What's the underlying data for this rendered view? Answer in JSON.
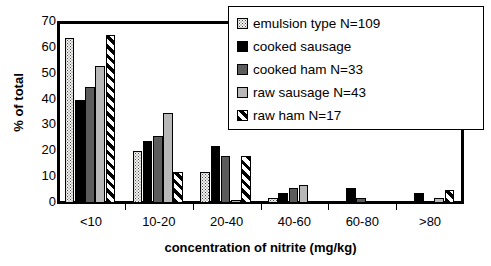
{
  "chart_data": {
    "type": "bar",
    "title": "",
    "xlabel": "concentration of nitrite (mg/kg)",
    "ylabel": "% of total",
    "categories": [
      "<10",
      "10-20",
      "20-40",
      "40-60",
      "60-80",
      ">80"
    ],
    "ylim": [
      0,
      70
    ],
    "yticks": [
      0,
      10,
      20,
      30,
      40,
      50,
      60,
      70
    ],
    "grid": true,
    "legend_position": "top-right",
    "series": [
      {
        "name": "emulsion type N=109",
        "pattern": "dotted",
        "color": "#f2f2f0",
        "values": [
          64,
          20,
          12,
          2,
          0,
          0
        ]
      },
      {
        "name": "cooked sausage",
        "pattern": "solid-black",
        "color": "#000000",
        "values": [
          40,
          24,
          22,
          4,
          6,
          4
        ]
      },
      {
        "name": "cooked ham N=33",
        "pattern": "dark-gray",
        "color": "#5c5c5c",
        "values": [
          45,
          26,
          18,
          6,
          2,
          0
        ]
      },
      {
        "name": "raw sausage N=43",
        "pattern": "light-gray",
        "color": "#b8b8b8",
        "values": [
          53,
          35,
          1,
          7,
          0,
          2
        ]
      },
      {
        "name": "raw ham N=17",
        "pattern": "diagonal-stripes",
        "color": "#ffffff",
        "values": [
          65,
          12,
          18,
          0,
          0,
          5
        ]
      }
    ]
  },
  "legend": {
    "items": [
      {
        "label": "emulsion type N=109"
      },
      {
        "label": "cooked sausage"
      },
      {
        "label": "cooked ham N=33"
      },
      {
        "label": "raw sausage N=43"
      },
      {
        "label": "raw ham N=17"
      }
    ]
  },
  "axes": {
    "y_title": "% of total",
    "x_title": "concentration of nitrite (mg/kg)",
    "y_tick_labels": [
      "70",
      "60",
      "50",
      "40",
      "30",
      "20",
      "10",
      "0"
    ],
    "x_tick_labels": [
      "<10",
      "10-20",
      "20-40",
      "40-60",
      "60-80",
      ">80"
    ]
  }
}
